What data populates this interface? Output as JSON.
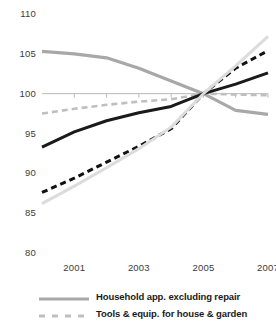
{
  "chart_data": {
    "type": "line",
    "title": "",
    "subtitle": "",
    "xlabel": "",
    "ylabel": "",
    "x": [
      2000,
      2001,
      2002,
      2003,
      2004,
      2005,
      2006,
      2007
    ],
    "xlim": [
      2000,
      2007
    ],
    "ylim": [
      80,
      110
    ],
    "xticks": [
      2001,
      2003,
      2005,
      2007
    ],
    "xtick_labels": [
      "2001",
      "2003",
      "2005",
      "2007"
    ],
    "yticks": [
      80,
      85,
      90,
      95,
      100,
      105,
      110
    ],
    "ytick_labels": [
      "80",
      "85",
      "90",
      "95",
      "100",
      "105",
      "110"
    ],
    "grid": false,
    "axis_line_value": 100,
    "legend_position": "bottom",
    "series": [
      {
        "name": "Household app. excluding repair",
        "style": "solid",
        "color": "#a8a8a8",
        "width": 3.2,
        "in_legend": true,
        "values": [
          105.3,
          105.0,
          104.5,
          103.2,
          101.6,
          100.0,
          97.9,
          97.4
        ]
      },
      {
        "name": "Tools & equip. for house & garden",
        "style": "dashed",
        "color": "#bfbfbf",
        "width": 2.6,
        "in_legend": true,
        "values": [
          97.5,
          98.1,
          98.6,
          99.0,
          99.3,
          100.0,
          99.9,
          99.8
        ]
      },
      {
        "name": "series-black-solid",
        "style": "solid",
        "color": "#1a1a1a",
        "width": 3.0,
        "in_legend": false,
        "values": [
          93.3,
          95.2,
          96.6,
          97.6,
          98.4,
          100.0,
          101.2,
          102.6
        ]
      },
      {
        "name": "series-black-dashed",
        "style": "dashed",
        "color": "#111111",
        "width": 3.0,
        "in_legend": false,
        "values": [
          87.6,
          89.4,
          91.4,
          93.4,
          95.6,
          100.0,
          103.2,
          105.4
        ]
      },
      {
        "name": "series-light-gray-solid",
        "style": "solid",
        "color": "#dcdcdc",
        "width": 3.0,
        "in_legend": false,
        "values": [
          86.2,
          88.4,
          90.7,
          93.1,
          95.8,
          100.0,
          103.5,
          107.2
        ]
      }
    ],
    "legend": [
      {
        "label": "Household app. excluding repair",
        "style": "solid",
        "color": "#a8a8a8"
      },
      {
        "label": "Tools & equip. for house & garden",
        "style": "dashed",
        "color": "#bfbfbf"
      }
    ]
  }
}
